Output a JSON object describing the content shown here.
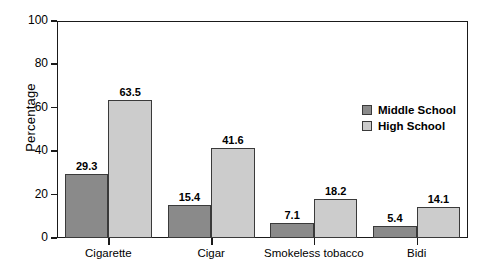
{
  "chart_data": {
    "type": "bar",
    "title": "",
    "xlabel": "",
    "ylabel": "Percentage",
    "ylim": [
      0,
      100
    ],
    "yticks": [
      0,
      20,
      40,
      60,
      80,
      100
    ],
    "grid": false,
    "legend_position": "upper right",
    "categories": [
      "Cigarette",
      "Cigar",
      "Smokeless tobacco",
      "Bidi"
    ],
    "series": [
      {
        "name": "Middle School",
        "color": "#8a8a8a",
        "values": [
          29.3,
          15.4,
          7.1,
          5.4
        ]
      },
      {
        "name": "High School",
        "color": "#cccccc",
        "values": [
          63.5,
          41.6,
          18.2,
          14.1
        ]
      }
    ],
    "value_labels": [
      [
        "29.3",
        "15.4",
        "7.1",
        "5.4"
      ],
      [
        "63.5",
        "41.6",
        "18.2",
        "14.1"
      ]
    ],
    "ytick_labels": [
      "0",
      "20",
      "40",
      "60",
      "80",
      "100"
    ]
  },
  "colors": {
    "middle_school": "#8a8a8a",
    "high_school": "#cccccc",
    "axis": "#1a1a1a",
    "bar_outline": "#3a3a3a",
    "background": "#ffffff"
  }
}
